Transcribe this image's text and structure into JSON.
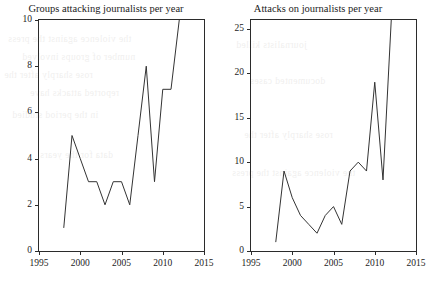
{
  "figure": {
    "background_color": "#ffffff",
    "line_color": "#333333",
    "axis_color": "#2b2b2b"
  },
  "bleed_text": [
    "the violence against the press",
    "number of groups involved",
    "rose sharply after the",
    "reported attacks have",
    "in the period studied",
    "data for the years",
    "journalists killed",
    "documented cases"
  ],
  "chart_data": [
    {
      "type": "line",
      "title": "Groups attacking journalists per year",
      "xlabel": "",
      "ylabel": "",
      "xlim": [
        1995,
        2015
      ],
      "ylim": [
        0,
        10
      ],
      "xticks": [
        1995,
        2000,
        2005,
        2010,
        2015
      ],
      "yticks": [
        0,
        2,
        4,
        6,
        8,
        10
      ],
      "grid": false,
      "legend": "none",
      "x": [
        1998,
        1999,
        2000,
        2001,
        2002,
        2003,
        2004,
        2005,
        2006,
        2007,
        2008,
        2009,
        2010,
        2011,
        2012
      ],
      "values": [
        1,
        5,
        4,
        3,
        3,
        2,
        3,
        3,
        2,
        5,
        8,
        3,
        7,
        7,
        10
      ]
    },
    {
      "type": "line",
      "title": "Attacks on journalists per year",
      "xlabel": "",
      "ylabel": "",
      "xlim": [
        1995,
        2015
      ],
      "ylim": [
        0,
        26
      ],
      "xticks": [
        1995,
        2000,
        2005,
        2010,
        2015
      ],
      "yticks": [
        0,
        5,
        10,
        15,
        20,
        25
      ],
      "grid": false,
      "legend": "none",
      "x": [
        1998,
        1999,
        2000,
        2001,
        2002,
        2003,
        2004,
        2005,
        2006,
        2007,
        2008,
        2009,
        2010,
        2011,
        2012
      ],
      "values": [
        1,
        9,
        6,
        4,
        3,
        2,
        4,
        5,
        3,
        9,
        10,
        9,
        19,
        8,
        26
      ]
    }
  ]
}
